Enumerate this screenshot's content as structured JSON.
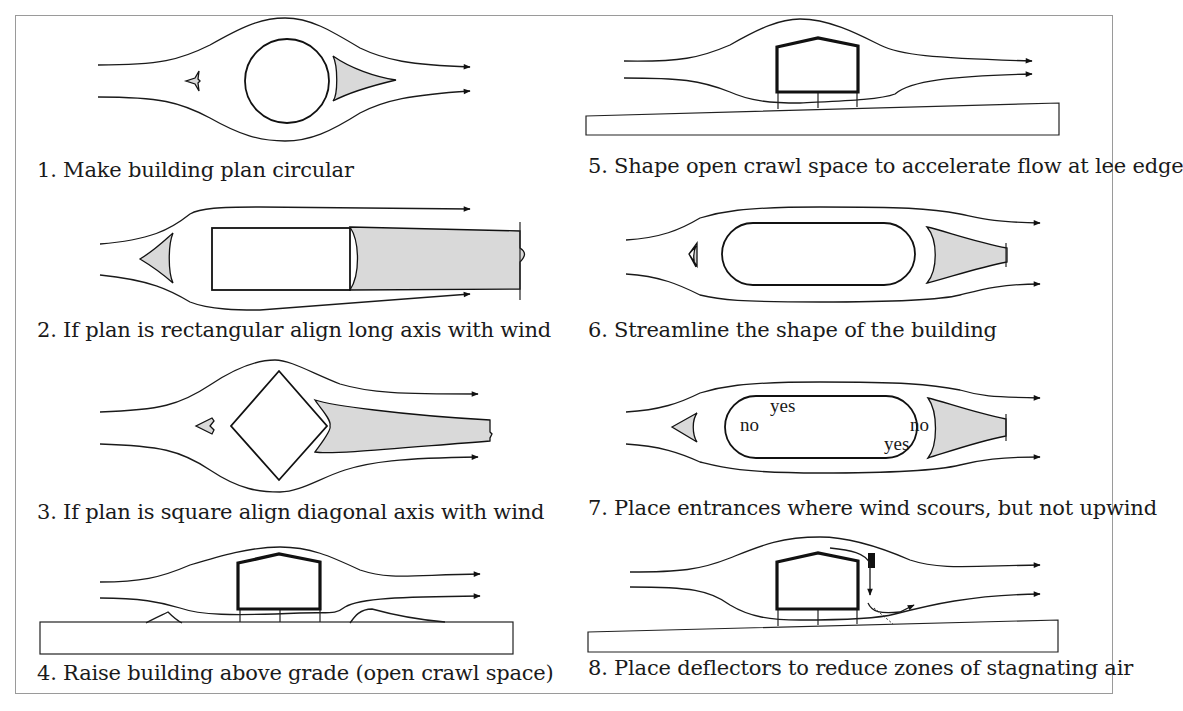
{
  "figure": {
    "type": "diagram",
    "panels": [
      {
        "number": "1",
        "caption": "1. Make building plan circular",
        "shape": "circle"
      },
      {
        "number": "2",
        "caption": "2. If plan is rectangular align long axis with wind",
        "shape": "rectangle"
      },
      {
        "number": "3",
        "caption": "3. If plan is square align diagonal axis with wind",
        "shape": "diamond"
      },
      {
        "number": "4",
        "caption": "4. Raise building above grade (open crawl space)",
        "shape": "raised-section"
      },
      {
        "number": "5",
        "caption": "5. Shape open crawl space to accelerate flow at lee edge",
        "shape": "raised-section-sloped"
      },
      {
        "number": "6",
        "caption": "6. Streamline the shape of the building",
        "shape": "stadium"
      },
      {
        "number": "7",
        "caption": "7. Place entrances where wind scours, but not upwind",
        "shape": "stadium-labeled",
        "labels": {
          "yes_top": "yes",
          "no_left": "no",
          "no_right": "no",
          "yes_bottom": "yes"
        }
      },
      {
        "number": "8",
        "caption": "8. Place deflectors to reduce zones of stagnating air",
        "shape": "raised-section-deflector"
      }
    ],
    "colors": {
      "wake_fill": "#d9d9d9",
      "line": "#111111",
      "frame": "#9a9a9a"
    }
  }
}
